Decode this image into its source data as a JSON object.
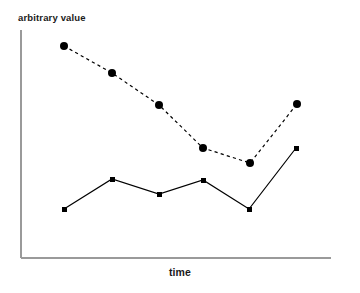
{
  "chart_data": {
    "type": "line",
    "title": "",
    "subtitle": "",
    "xlabel": "time",
    "ylabel": "arbitrary value",
    "grid": false,
    "legend": null,
    "legend_position": "none",
    "xlim": [
      0,
      7
    ],
    "ylim": [
      0,
      10
    ],
    "x": [
      1,
      2,
      3,
      4,
      5,
      6
    ],
    "series": [
      {
        "name": "dashed-series",
        "linestyle": "dashed",
        "marker": "circle",
        "marker_size": 8,
        "color": "#000000",
        "values": [
          9.3,
          7.9,
          6.2,
          4.0,
          3.3,
          6.3
        ],
        "points": [
          {
            "x": 64,
            "y": 46
          },
          {
            "x": 112,
            "y": 73
          },
          {
            "x": 159,
            "y": 105
          },
          {
            "x": 203,
            "y": 148
          },
          {
            "x": 250,
            "y": 163
          },
          {
            "x": 297,
            "y": 104
          }
        ]
      },
      {
        "name": "solid-series",
        "linestyle": "solid",
        "marker": "square",
        "marker_size": 5,
        "color": "#000000",
        "values": [
          2.0,
          3.4,
          2.7,
          3.3,
          2.0,
          4.8
        ],
        "points": [
          {
            "x": 64,
            "y": 209
          },
          {
            "x": 112,
            "y": 179
          },
          {
            "x": 159,
            "y": 194
          },
          {
            "x": 203,
            "y": 180
          },
          {
            "x": 249,
            "y": 209
          },
          {
            "x": 296,
            "y": 148
          }
        ]
      }
    ],
    "axes": {
      "color": "#9a9a9a",
      "x_axis": {
        "x1": 21,
        "y1": 258,
        "x2": 331,
        "y2": 258
      },
      "y_axis": {
        "x1": 21,
        "y1": 30,
        "x2": 21,
        "y2": 258
      }
    },
    "ticks": {
      "x": [],
      "y": []
    },
    "annotations": []
  }
}
